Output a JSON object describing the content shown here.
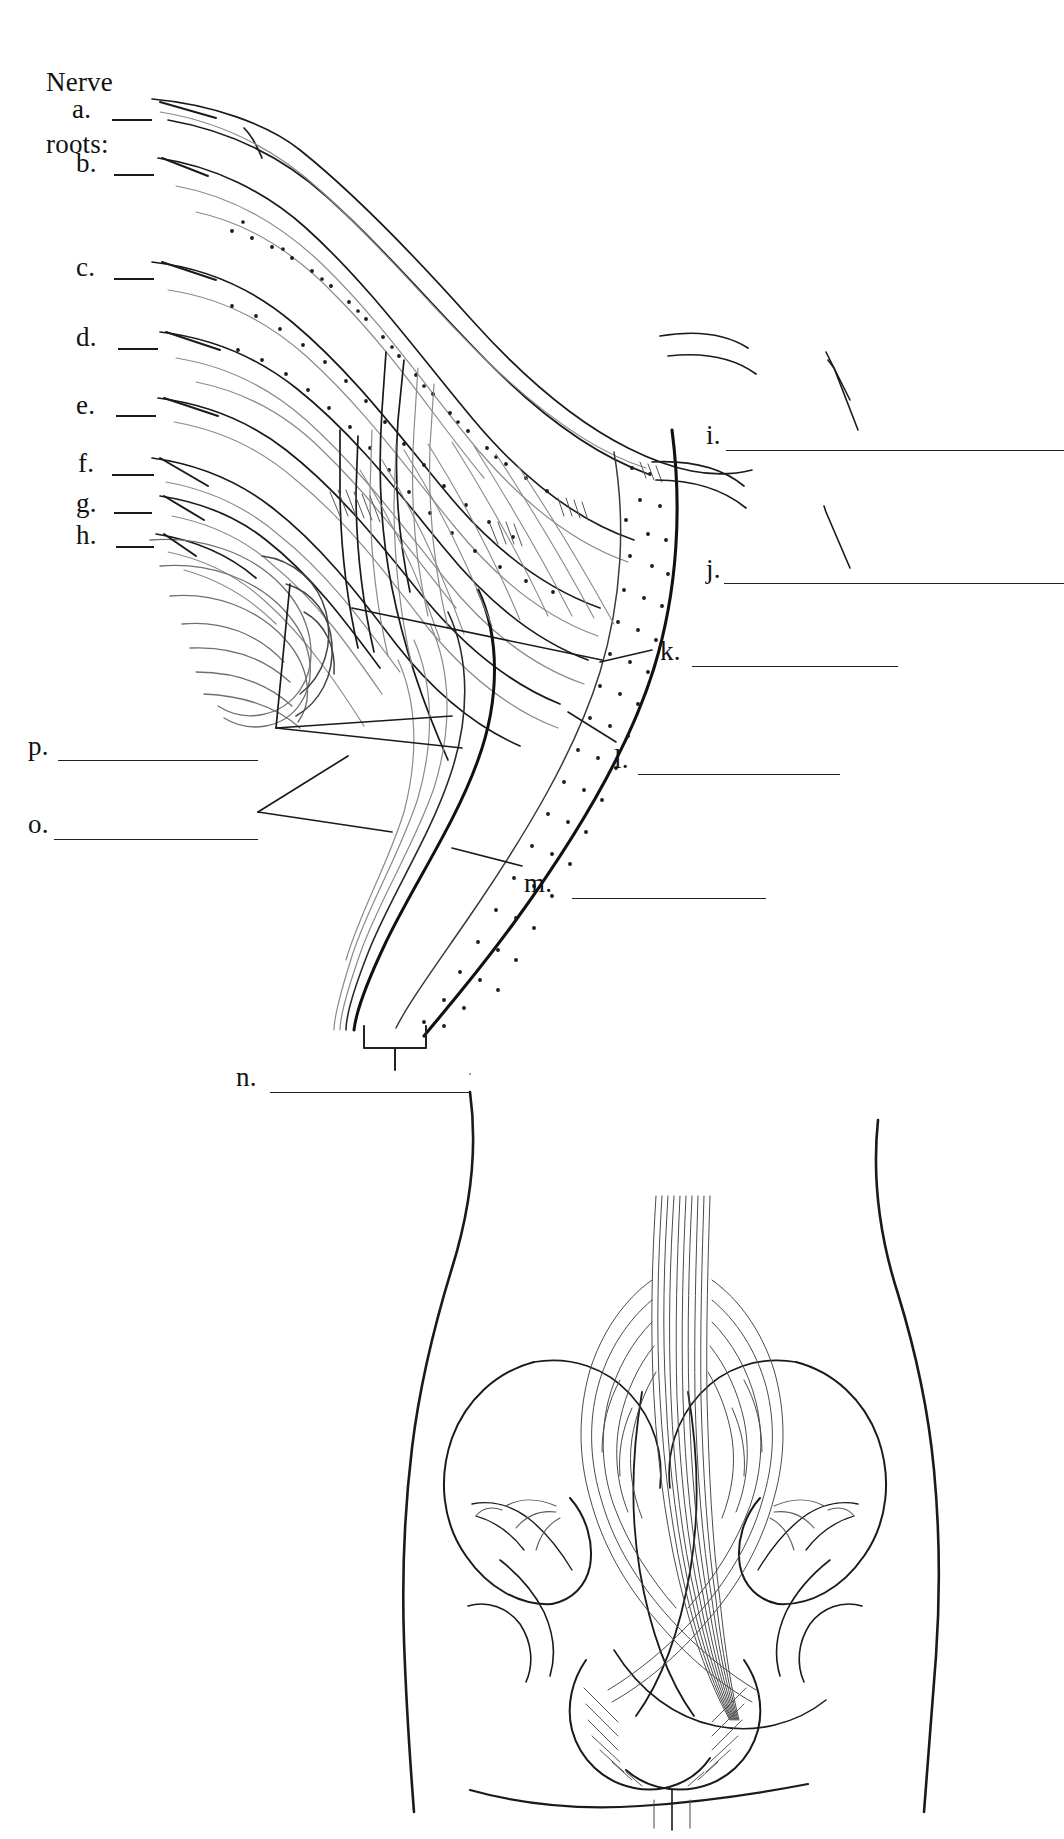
{
  "figure": {
    "kind": "anatomy-labeling-worksheet",
    "ink_color": "#1a1a1a",
    "background_color": "#ffffff"
  },
  "heading": {
    "text": "Nerve\nroots:",
    "line1": "Nerve",
    "line2": "roots:"
  },
  "left_root_labels": [
    {
      "id": "a",
      "text": "a.",
      "x": 72,
      "y": 96,
      "rule_x": 112,
      "rule_w": 40,
      "leader": "up-right"
    },
    {
      "id": "b",
      "text": "b.",
      "x": 76,
      "y": 150,
      "rule_x": 114,
      "rule_w": 40,
      "leader": "up-right"
    },
    {
      "id": "c",
      "text": "c.",
      "x": 76,
      "y": 254,
      "rule_x": 114,
      "rule_w": 40,
      "leader": "up-right"
    },
    {
      "id": "d",
      "text": "d.",
      "x": 76,
      "y": 324,
      "rule_x": 118,
      "rule_w": 40,
      "leader": "up-right"
    },
    {
      "id": "e",
      "text": "e.",
      "x": 76,
      "y": 392,
      "rule_x": 116,
      "rule_w": 40,
      "leader": "up-right"
    },
    {
      "id": "f",
      "text": "f.",
      "x": 78,
      "y": 450,
      "rule_x": 112,
      "rule_w": 40,
      "leader": "up-right"
    },
    {
      "id": "g",
      "text": "g.",
      "x": 76,
      "y": 490,
      "rule_x": 114,
      "rule_w": 36,
      "leader": "up-right"
    },
    {
      "id": "h",
      "text": "h.",
      "x": 76,
      "y": 522,
      "rule_x": 116,
      "rule_w": 36,
      "leader": "up-right"
    }
  ],
  "right_labels": [
    {
      "id": "i",
      "text": "i.",
      "x": 706,
      "y": 422,
      "rule_x": 726,
      "rule_w": 338,
      "leader": "up-left"
    },
    {
      "id": "j",
      "text": "j.",
      "x": 706,
      "y": 556,
      "rule_x": 724,
      "rule_w": 340,
      "leader": "up-left"
    },
    {
      "id": "k",
      "text": "k.",
      "x": 660,
      "y": 638,
      "rule_x": 690,
      "rule_w": 208,
      "leader": "left"
    },
    {
      "id": "l",
      "text": "l.",
      "x": 614,
      "y": 746,
      "rule_x": 636,
      "rule_w": 204,
      "leader": "up-left"
    },
    {
      "id": "m",
      "text": "m.",
      "x": 524,
      "y": 870,
      "rule_x": 570,
      "rule_w": 196,
      "leader": "up-left"
    }
  ],
  "lower_left_labels": [
    {
      "id": "p",
      "text": "p.",
      "x": 28,
      "y": 733,
      "rule_x": 56,
      "rule_w": 202,
      "leader": "right-fan"
    },
    {
      "id": "o",
      "text": "o.",
      "x": 28,
      "y": 811,
      "rule_x": 52,
      "rule_w": 206,
      "leader": "right-fan"
    },
    {
      "id": "n",
      "text": "n.",
      "x": 236,
      "y": 1064,
      "rule_x": 268,
      "rule_w": 202,
      "leader": "bracket-up"
    }
  ],
  "illustration": {
    "main_panel": {
      "description": "Left-lateral view of the lumbosacral plexus: eight spinal nerve roots descending from upper left, converging through a stippled (dotted) sacral plexus sheet into a thick nerve trunk that curves down and right, ending at a bracket at the bottom.",
      "stipple_dot_color": "#444444",
      "outline_color": "#1a1a1a"
    },
    "inset_panel": {
      "description": "Posterior orientation drawing of the lower torso and pelvis showing the sacral plexus in situ, with iliac crests, sacrum, hip joints, and radiating nerve fibers.",
      "outline_color": "#1a1a1a"
    },
    "bracket": {
      "description": "Square bracket marking the terminal nerve trunk",
      "x": 364,
      "y": 1026,
      "width": 62,
      "height": 22
    }
  }
}
